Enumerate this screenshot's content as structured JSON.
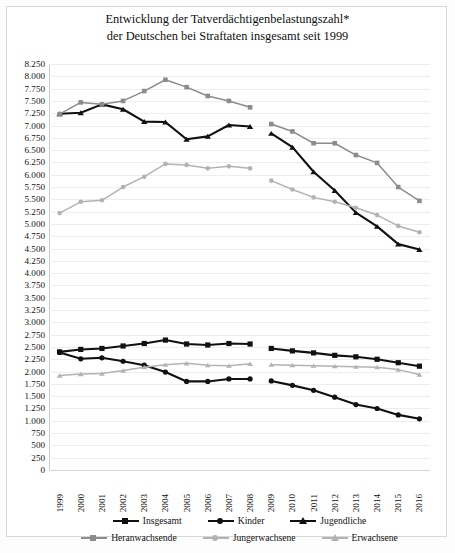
{
  "title": {
    "line1": "Entwicklung der Tatverdächtigenbelastungszahl*",
    "line2": "der Deutschen bei Straftaten insgesamt seit 1999"
  },
  "chart_data": {
    "type": "line",
    "title": "Entwicklung der Tatverdächtigenbelastungszahl* der Deutschen bei Straftaten insgesamt seit 1999",
    "xlabel": "",
    "ylabel": "",
    "ylim": [
      0,
      8250
    ],
    "ytick_step": 250,
    "grid": true,
    "legend_position": "bottom",
    "note": "Datenbruch zwischen 2008 und 2009 - Serien sind unterbrochen",
    "categories": [
      "1999",
      "2000",
      "2001",
      "2002",
      "2003",
      "2004",
      "2005",
      "2006",
      "2007",
      "2008",
      "2009",
      "2010",
      "2011",
      "2012",
      "2013",
      "2014",
      "2015",
      "2016"
    ],
    "ytick_labels": [
      "8.250",
      "8.000",
      "7.750",
      "7.500",
      "7.250",
      "7.000",
      "6.750",
      "6.500",
      "6.250",
      "6.000",
      "5.750",
      "5.500",
      "5.250",
      "5.000",
      "4.750",
      "4.500",
      "4.250",
      "4.000",
      "3.750",
      "3.500",
      "3.250",
      "3.000",
      "2.750",
      "2.500",
      "2.250",
      "2.000",
      "1.750",
      "1.500",
      "1.250",
      "1.000",
      "750",
      "500",
      "250",
      "0"
    ],
    "series": [
      {
        "name": "Insgesamt",
        "color": "#111111",
        "marker": "square",
        "values": [
          2400,
          2450,
          2470,
          2520,
          2570,
          2640,
          2560,
          2540,
          2570,
          2560,
          2470,
          2420,
          2380,
          2330,
          2300,
          2250,
          2180,
          2110
        ]
      },
      {
        "name": "Kinder",
        "color": "#111111",
        "marker": "circle",
        "values": [
          2390,
          2260,
          2280,
          2210,
          2130,
          1990,
          1800,
          1800,
          1850,
          1850,
          1810,
          1720,
          1620,
          1480,
          1330,
          1250,
          1120,
          1040
        ]
      },
      {
        "name": "Jugendliche",
        "color": "#111111",
        "marker": "triangle",
        "values": [
          7240,
          7260,
          7430,
          7330,
          7080,
          7070,
          6720,
          6780,
          7010,
          6980,
          6840,
          6560,
          6060,
          5680,
          5230,
          4950,
          4590,
          4480
        ]
      },
      {
        "name": "Heranwachsende",
        "color": "#8c8c8c",
        "marker": "square",
        "values": [
          7230,
          7470,
          7430,
          7500,
          7700,
          7930,
          7780,
          7600,
          7500,
          7370,
          7030,
          6880,
          6640,
          6640,
          6400,
          6240,
          5750,
          5470
        ]
      },
      {
        "name": "Jungerwachsene",
        "color": "#b3b3b3",
        "marker": "circle",
        "values": [
          5220,
          5450,
          5480,
          5750,
          5960,
          6220,
          6200,
          6130,
          6170,
          6130,
          5880,
          5700,
          5540,
          5450,
          5330,
          5180,
          4960,
          4830
        ]
      },
      {
        "name": "Erwachsene",
        "color": "#b3b3b3",
        "marker": "triangle",
        "values": [
          1920,
          1950,
          1960,
          2020,
          2090,
          2140,
          2170,
          2130,
          2120,
          2160,
          2140,
          2130,
          2120,
          2110,
          2100,
          2090,
          2040,
          1940
        ]
      }
    ],
    "break_after_index": 9
  },
  "legend": {
    "row1": [
      "Insgesamt",
      "Kinder",
      "Jugendliche"
    ],
    "row2": [
      "Heranwachsende",
      "Jungerwachsene",
      "Erwachsene"
    ]
  }
}
